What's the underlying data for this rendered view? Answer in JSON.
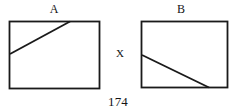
{
  "document": {
    "page_number": "174",
    "figure": {
      "type": "geometry-diagram",
      "description": "Two rectangles labeled A and B, each crossed by a single straight segment, separated by the letter X",
      "stroke_color": "#1a1a1a",
      "background_color": "#ffffff"
    }
  },
  "labels": {
    "rect_a": "A",
    "rect_b": "B",
    "separator": "X"
  },
  "shapes": [
    {
      "name": "rectangle-a",
      "label": "A",
      "x": 9,
      "y": 21,
      "width": 91,
      "height": 68,
      "segment": {
        "name": "diagonal-a",
        "x1": 9,
        "y1": 54,
        "x2": 70,
        "y2": 21,
        "note": "rises from left edge to top edge"
      }
    },
    {
      "name": "rectangle-b",
      "label": "B",
      "x": 141,
      "y": 21,
      "width": 87,
      "height": 67,
      "segment": {
        "name": "diagonal-b",
        "x1": 142,
        "y1": 55,
        "x2": 209,
        "y2": 88,
        "note": "falls from left edge to bottom edge"
      }
    }
  ]
}
